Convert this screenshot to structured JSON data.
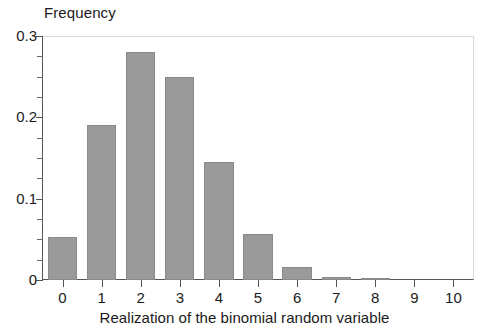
{
  "chart_data": {
    "type": "bar",
    "title": "",
    "xlabel": "Realization of the binomial random variable",
    "ylabel": "Frequency",
    "categories": [
      "0",
      "1",
      "2",
      "3",
      "4",
      "5",
      "6",
      "7",
      "8",
      "9",
      "10"
    ],
    "values": [
      0.053,
      0.19,
      0.28,
      0.249,
      0.145,
      0.057,
      0.016,
      0.004,
      0.001,
      0.0,
      0.0
    ],
    "series": [
      {
        "name": "Frequency",
        "values": [
          0.053,
          0.19,
          0.28,
          0.249,
          0.145,
          0.057,
          0.016,
          0.004,
          0.001,
          0.0,
          0.0
        ]
      }
    ],
    "ylim": [
      0,
      0.3
    ],
    "xlim": [
      -0.5,
      10.5
    ],
    "y_major_ticks": [
      0,
      0.1,
      0.2,
      0.3
    ],
    "y_major_tick_labels": [
      "0",
      "0.1",
      "0.2",
      "0.3"
    ],
    "y_minor_tick_interval": 0.025,
    "x_ticks": [
      0,
      1,
      2,
      3,
      4,
      5,
      6,
      7,
      8,
      9,
      10
    ],
    "grid": false,
    "legend": null,
    "bar_color": "#9a9a9a",
    "bar_edge_color": "#8a8a8a",
    "axis_color": "#555555",
    "background_color": "#ffffff"
  },
  "axes": {
    "ylabel_text": "Frequency",
    "xlabel_text": "Realization of the binomial random variable"
  },
  "ytick_labels": [
    "0.3",
    "0.2",
    "0.1",
    "0"
  ],
  "xtick_labels": [
    "0",
    "1",
    "2",
    "3",
    "4",
    "5",
    "6",
    "7",
    "8",
    "9",
    "10"
  ]
}
